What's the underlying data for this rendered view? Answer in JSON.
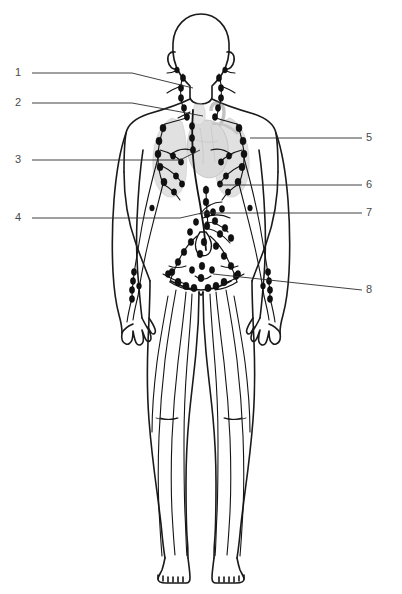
{
  "figure": {
    "title_fragment": "",
    "view": "anterior full-body",
    "line_color": "#1a1a1a",
    "organ_tint_color": "#b9b9b9",
    "label_color": "#4a4a4a",
    "background_color": "#ffffff"
  },
  "callouts": {
    "left": [
      {
        "number": "1",
        "x": 18,
        "y": 73,
        "line_x1": 32,
        "line_y1": 73,
        "line_bend_x": 132,
        "line_bend_y": 73,
        "line_x2": 193,
        "line_y2": 88
      },
      {
        "number": "2",
        "x": 18,
        "y": 103,
        "line_x1": 32,
        "line_y1": 103,
        "line_bend_x": 132,
        "line_bend_y": 103,
        "line_x2": 203,
        "line_y2": 116
      },
      {
        "number": "3",
        "x": 18,
        "y": 158,
        "line_x1": 32,
        "line_y1": 160,
        "line_bend_x": 180,
        "line_bend_y": 160,
        "line_x2": 200,
        "line_y2": 150
      },
      {
        "number": "4",
        "x": 18,
        "y": 216,
        "line_x1": 32,
        "line_y1": 218,
        "line_bend_x": 180,
        "line_bend_y": 218,
        "line_x2": 202,
        "line_y2": 213
      }
    ],
    "right": [
      {
        "number": "5",
        "x": 368,
        "y": 136,
        "line_x1": 250,
        "line_y1": 138,
        "line_x2": 362,
        "line_y2": 138
      },
      {
        "number": "6",
        "x": 368,
        "y": 183,
        "line_x1": 218,
        "line_y1": 185,
        "line_x2": 362,
        "line_y2": 185
      },
      {
        "number": "7",
        "x": 368,
        "y": 211,
        "line_x1": 200,
        "line_y1": 213,
        "line_x2": 362,
        "line_y2": 213
      },
      {
        "number": "8",
        "x": 368,
        "y": 288,
        "line_x1": 213,
        "line_y1": 274,
        "line_x2": 362,
        "line_y2": 290
      }
    ]
  },
  "anatomy": {
    "regions": [
      "head",
      "neck",
      "thorax",
      "heart",
      "thoracic-duct",
      "axilla-left",
      "axilla-right",
      "abdomen",
      "pelvis",
      "arms",
      "legs",
      "feet"
    ]
  }
}
